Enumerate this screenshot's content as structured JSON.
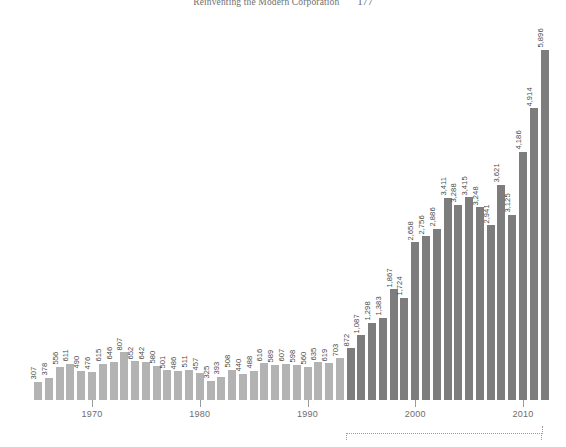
{
  "header": {
    "title": "Reinventing the Modern Corporation",
    "page_number": "177"
  },
  "chart_data": {
    "type": "bar",
    "title": "",
    "xlabel": "",
    "ylabel": "",
    "grid": false,
    "legend": "none",
    "ylim": [
      0,
      5896
    ],
    "xticks": [
      "1970",
      "1980",
      "1990",
      "2000",
      "2010"
    ],
    "xtick_years": [
      1970,
      1980,
      1990,
      2000,
      2010
    ],
    "series": [
      {
        "name": "light",
        "color": "#b3b3b3",
        "categories": [
          1965,
          1966,
          1967,
          1968,
          1969,
          1970,
          1971,
          1972,
          1973,
          1974,
          1975,
          1976,
          1977,
          1978,
          1979,
          1980,
          1981,
          1982,
          1983,
          1984,
          1985,
          1986,
          1987,
          1988,
          1989,
          1990,
          1991,
          1992,
          1993
        ],
        "values": [
          307,
          378,
          556,
          611,
          490,
          476,
          615,
          646,
          807,
          652,
          642,
          580,
          501,
          486,
          511,
          457,
          325,
          393,
          508,
          440,
          488,
          616,
          589,
          607,
          598,
          560,
          635,
          619,
          703
        ],
        "labels": [
          "307",
          "378",
          "556",
          "611",
          "490",
          "476",
          "615",
          "646",
          "807",
          "652",
          "642",
          "580",
          "501",
          "486",
          "511",
          "457",
          "325",
          "393",
          "508",
          "440",
          "488",
          "616",
          "589",
          "607",
          "598",
          "560",
          "635",
          "619",
          "703"
        ]
      },
      {
        "name": "dark",
        "color": "#7d7d7d",
        "categories": [
          1994,
          1995,
          1996,
          1997,
          1998,
          1999,
          2000,
          2001,
          2002,
          2003,
          2004,
          2005,
          2006,
          2007,
          2008,
          2009,
          2010,
          2011
        ],
        "values": [
          872,
          1087,
          1298,
          1383,
          1867,
          1724,
          2658,
          2756,
          2886,
          3411,
          3288,
          3415,
          3248,
          2941,
          3621,
          3125,
          4186,
          4914
        ],
        "labels": [
          "872",
          "1,087",
          "1,298",
          "1,383",
          "1,867",
          "1,724",
          "2,658",
          "2,756",
          "2,886",
          "3,411",
          "3,288",
          "3,415",
          "3,248",
          "2,941",
          "3,621",
          "3,125",
          "4,186",
          "4,914"
        ]
      },
      {
        "name": "dark-final",
        "color": "#7d7d7d",
        "categories": [
          2012
        ],
        "values": [
          5896
        ],
        "labels": [
          "5,896"
        ]
      }
    ],
    "annotation": {
      "type": "dotted-bracket",
      "start_year": 1994,
      "end_year": 2011,
      "label": ""
    }
  },
  "colors": {
    "bar_light": "#b3b3b3",
    "bar_light_alt": "#bdbdbd",
    "bar_dark": "#7d7d7d",
    "axis": "#9a9a9a",
    "label_text": "#4a4a4a",
    "tick_text": "#6d6d6d",
    "header_text": "#6f6f6f",
    "background": "#ffffff"
  }
}
